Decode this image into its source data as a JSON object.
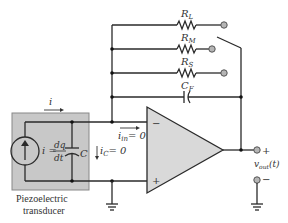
{
  "diagram": {
    "type": "circuit-schematic",
    "colors": {
      "wire": "#2a2a2a",
      "transducer_fill": "#c8c8c8",
      "opamp_fill": "#d9d9d9",
      "terminal_fill": "#b5b5b5"
    },
    "feedback": {
      "resistors": [
        {
          "name": "R_L",
          "label_main": "R",
          "label_sub": "L"
        },
        {
          "name": "R_M",
          "label_main": "R",
          "label_sub": "M"
        },
        {
          "name": "R_S",
          "label_main": "R",
          "label_sub": "S"
        }
      ],
      "capacitor": {
        "name": "C_F",
        "label_main": "C",
        "label_sub": "F"
      },
      "switch": "selector-switch"
    },
    "transducer": {
      "label_line1": "Piezoelectric",
      "label_line2": "transducer",
      "source_eq_lhs": "i =",
      "source_eq_num": "dq",
      "source_eq_den": "dt",
      "capacitor_label": "C"
    },
    "currents": {
      "i": "i",
      "i_in_main": "i",
      "i_in_sub": "in",
      "i_in_value": "= 0",
      "i_c_main": "i",
      "i_c_sub": "C",
      "i_c_value": "= 0"
    },
    "opamp": {
      "inverting": "−",
      "noninverting": "+"
    },
    "output": {
      "plus": "+",
      "minus": "−",
      "label_main": "v",
      "label_sub": "out",
      "label_arg": "(t)"
    }
  }
}
